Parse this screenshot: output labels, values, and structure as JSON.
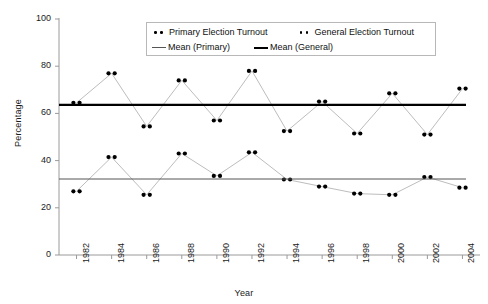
{
  "chart_data": {
    "type": "scatter",
    "title": "",
    "xlabel": "Year",
    "ylabel": "Percentage",
    "ylim": [
      0,
      100
    ],
    "ytick_step": 20,
    "yticks": [
      "0",
      "20",
      "40",
      "60",
      "80",
      "100"
    ],
    "xlim": [
      1981,
      2005
    ],
    "categories": [
      "1982",
      "1984",
      "1986",
      "1988",
      "1990",
      "1992",
      "1994",
      "1996",
      "1998",
      "2000",
      "2002",
      "2004"
    ],
    "xticks": [
      "1982",
      "1984",
      "1986",
      "1988",
      "1990",
      "1992",
      "1994",
      "1996",
      "1998",
      "2000",
      "2002",
      "2004"
    ],
    "grid": false,
    "legend_position": "top-center",
    "marker_style": "paired-dots",
    "series": [
      {
        "name": "Primary Election Turnout",
        "color": "#000000",
        "values": [
          27,
          41.5,
          25.5,
          43,
          33.5,
          43.5,
          32,
          29,
          26,
          25.5,
          33,
          28.5
        ]
      },
      {
        "name": "General Election Turnout",
        "color": "#000000",
        "values": [
          64.5,
          77,
          54.5,
          74,
          57,
          78,
          52.5,
          65,
          51.5,
          68.5,
          51,
          70.5
        ]
      }
    ],
    "reference_lines": [
      {
        "name": "Mean (Primary)",
        "value": 32.2,
        "color": "#555555",
        "width": 1
      },
      {
        "name": "Mean (General)",
        "value": 63.6,
        "color": "#000000",
        "width": 2.2
      }
    ],
    "legend": [
      {
        "label": "Primary Election Turnout",
        "type": "marker"
      },
      {
        "label": "General Election Turnout",
        "type": "marker"
      },
      {
        "label": "Mean (Primary)",
        "type": "line-thin"
      },
      {
        "label": "Mean (General)",
        "type": "line-thick"
      }
    ]
  }
}
